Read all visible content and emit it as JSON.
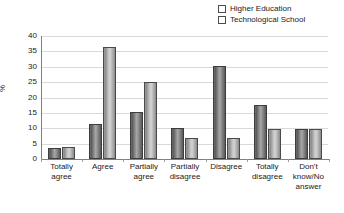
{
  "chart_data": {
    "type": "bar",
    "title": "",
    "xlabel": "",
    "ylabel": "%",
    "ylim": [
      0,
      40
    ],
    "yticks": [
      0,
      5,
      10,
      15,
      20,
      25,
      30,
      35,
      40
    ],
    "grid": true,
    "legend_position": "top-right",
    "categories": [
      "Totally agree",
      "Agree",
      "Partially agree",
      "Partially disagree",
      "Disagree",
      "Totally disagree",
      "Don't know/No answer"
    ],
    "series": [
      {
        "name": "Higher Education",
        "color": "#7d7d7d",
        "values": [
          3.7,
          11.5,
          15.3,
          10.0,
          30.4,
          17.7,
          9.9
        ]
      },
      {
        "name": "Technological School",
        "color": "#c3c3c3",
        "values": [
          4.0,
          36.5,
          25.2,
          6.8,
          6.8,
          9.6,
          9.6
        ]
      }
    ]
  },
  "legend": {
    "entries": [
      {
        "label": "Higher Education"
      },
      {
        "label": "Technological School"
      }
    ]
  },
  "axis": {
    "y_title": "%"
  }
}
